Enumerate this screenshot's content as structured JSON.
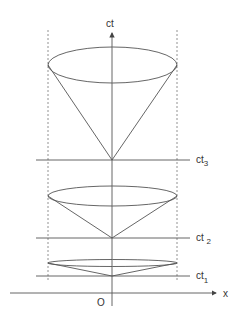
{
  "diagram": {
    "axes": {
      "vertical_label": "ct",
      "horizontal_label": "x",
      "origin_label": "O"
    },
    "time_slices": [
      {
        "label": "ct",
        "subscript": "3",
        "y": 160
      },
      {
        "label": "ct ",
        "subscript": "2",
        "y": 238
      },
      {
        "label": "ct",
        "subscript": "1",
        "y": 276
      }
    ],
    "cones": [
      {
        "name": "cone-top",
        "vertex_y": 160,
        "rim_y": 65,
        "rim_ry": 18
      },
      {
        "name": "cone-middle",
        "vertex_y": 238,
        "rim_y": 196,
        "rim_ry": 9
      },
      {
        "name": "cone-bottom",
        "vertex_y": 276,
        "rim_y": 263,
        "rim_ry": 3
      }
    ],
    "colors": {
      "line": "#555555",
      "dashed": "#777777",
      "text": "#333333"
    }
  }
}
